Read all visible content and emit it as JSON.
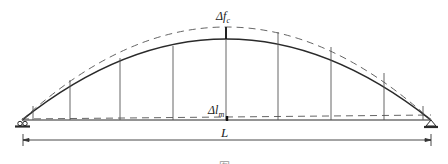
{
  "diagram": {
    "type": "arch-deformation",
    "labels": {
      "arch_rise_change": {
        "symbol": "Δf",
        "subscript": "c"
      },
      "span_change": {
        "symbol": "Δl",
        "subscript": "m"
      },
      "span": "L"
    },
    "caption": "图",
    "colors": {
      "line": "#2a2a2a",
      "dashed": "#666666",
      "hanger": "#555555"
    },
    "geometry": {
      "left_support_x": 22,
      "right_support_x": 431,
      "baseline_y": 120,
      "arch_apex_y": 39,
      "deformed_apex_y": 27,
      "deformed_baseline_y": 116,
      "hangers_x": [
        33,
        70,
        120,
        173,
        226,
        278,
        331,
        384,
        423
      ],
      "dimension_y": 140
    }
  }
}
